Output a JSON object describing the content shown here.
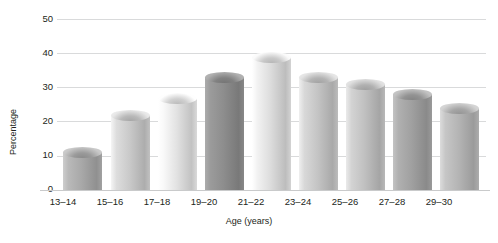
{
  "chart_data": {
    "type": "bar",
    "title": "",
    "subtitle": "",
    "xlabel": "Age (years)",
    "ylabel": "Percentage",
    "categories": [
      "13–14",
      "15–16",
      "17–18",
      "19–20",
      "21–22",
      "23–24",
      "25–26",
      "27–28",
      "29–30"
    ],
    "values": [
      11,
      22,
      27,
      33,
      39,
      33,
      31,
      28,
      24
    ],
    "yticks": [
      "0",
      "10",
      "20",
      "30",
      "40",
      "50"
    ],
    "ytick_values": [
      0,
      10,
      20,
      30,
      40,
      50
    ],
    "ylim": [
      0,
      50
    ],
    "grid": true,
    "legend": "none",
    "series": [
      {
        "name": "Percentage",
        "values": [
          11,
          22,
          27,
          33,
          39,
          33,
          31,
          28,
          24
        ]
      }
    ],
    "bar_colors": [
      "#a8a8a8",
      "#c9c9c9",
      "#e2e2e2",
      "#8d8d8d",
      "#dcdcdc",
      "#c4c4c4",
      "#c0c0c0",
      "#a0a0a0",
      "#b4b4b4"
    ],
    "bar_cap_colors": [
      "#bdbdbd",
      "#dadada",
      "#f0f0f0",
      "#a5a5a5",
      "#ececec",
      "#d6d6d6",
      "#d2d2d2",
      "#b6b6b6",
      "#c6c6c6"
    ],
    "gridline_color": "#d9dadb",
    "text_color": "#231f20",
    "background": "#ffffff"
  }
}
